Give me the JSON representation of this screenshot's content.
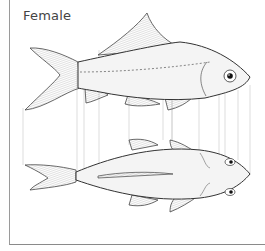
{
  "figure": {
    "title": "Female",
    "views": [
      "side-view",
      "top-view"
    ],
    "colors": {
      "outline": "#333333",
      "guide_lines": "#bdbdbd",
      "fin_hatch": "#888888",
      "body_fill": "#f4f4f4",
      "frame": "#9a9a9a"
    }
  }
}
